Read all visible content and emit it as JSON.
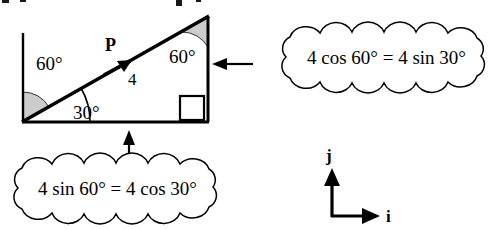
{
  "figure": {
    "stroke_color": "#000000",
    "sector_fill_color": "#cccccc",
    "background_color": "#ffffff"
  },
  "triangle": {
    "angles": {
      "base_left_label": "30°",
      "vertical_reference_left_label": "60°",
      "apex_label": "60°",
      "right_angle_marker": "square"
    }
  },
  "vector": {
    "name_label": "P",
    "magnitude_label": "4"
  },
  "callouts": [
    {
      "name": "horizontal-component-callout",
      "text": "4 cos 60° = 4 sin 30°",
      "points_to": "vertical-side"
    },
    {
      "name": "vertical-component-callout",
      "text": "4 sin 60° = 4 cos 30°",
      "points_to": "horizontal-base"
    }
  ],
  "axes": {
    "vertical_unit_label": "j",
    "horizontal_unit_label": "i"
  }
}
